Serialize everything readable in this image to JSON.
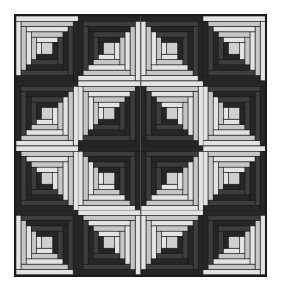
{
  "figure": {
    "kind": "quilt-pattern-illustration",
    "background_color": "#ffffff"
  },
  "quilt": {
    "rows": 4,
    "columns": 4,
    "block_count": 16,
    "block_name": "log-cabin",
    "setting_name": "barn-raising",
    "border_color": "#1b1b1b",
    "border_width_px": 2,
    "bounds": {
      "x": 14,
      "y": 14,
      "width": 253,
      "height": 263
    }
  },
  "palette": {
    "dark": "#262626",
    "dark_alt": "#3d3d3d",
    "light": "#e3e3e3",
    "light_alt": "#c6c6c6",
    "center": "#cfcfcf",
    "seam": "#1b1b1b",
    "paper": "#ffffff"
  },
  "block_structure": {
    "logs_per_side": 5,
    "center_square_fraction": 0.18,
    "log_width_fraction": 0.082,
    "description": "Center square surrounded by five rounds of logs; one half of each round is dark fabric, the opposite half is light fabric."
  },
  "blocks": [
    {
      "row": 0,
      "col": 0,
      "dark_corner": "bottom-right",
      "light_corner": "top-left"
    },
    {
      "row": 0,
      "col": 1,
      "dark_corner": "top-left",
      "light_corner": "bottom-right"
    },
    {
      "row": 0,
      "col": 2,
      "dark_corner": "top-right",
      "light_corner": "bottom-left"
    },
    {
      "row": 0,
      "col": 3,
      "dark_corner": "bottom-left",
      "light_corner": "top-right"
    },
    {
      "row": 1,
      "col": 0,
      "dark_corner": "top-left",
      "light_corner": "bottom-right"
    },
    {
      "row": 1,
      "col": 1,
      "dark_corner": "bottom-right",
      "light_corner": "top-left"
    },
    {
      "row": 1,
      "col": 2,
      "dark_corner": "bottom-left",
      "light_corner": "top-right"
    },
    {
      "row": 1,
      "col": 3,
      "dark_corner": "top-right",
      "light_corner": "bottom-left"
    },
    {
      "row": 2,
      "col": 0,
      "dark_corner": "bottom-left",
      "light_corner": "top-right"
    },
    {
      "row": 2,
      "col": 1,
      "dark_corner": "top-right",
      "light_corner": "bottom-left"
    },
    {
      "row": 2,
      "col": 2,
      "dark_corner": "top-left",
      "light_corner": "bottom-right"
    },
    {
      "row": 2,
      "col": 3,
      "dark_corner": "bottom-right",
      "light_corner": "top-left"
    },
    {
      "row": 3,
      "col": 0,
      "dark_corner": "top-right",
      "light_corner": "bottom-left"
    },
    {
      "row": 3,
      "col": 1,
      "dark_corner": "bottom-left",
      "light_corner": "top-right"
    },
    {
      "row": 3,
      "col": 2,
      "dark_corner": "bottom-right",
      "light_corner": "top-left"
    },
    {
      "row": 3,
      "col": 3,
      "dark_corner": "top-left",
      "light_corner": "bottom-right"
    }
  ]
}
